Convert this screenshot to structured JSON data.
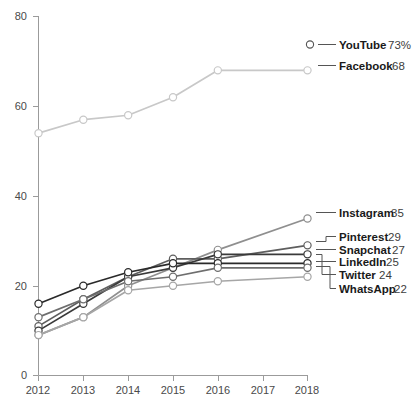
{
  "chart_data": {
    "type": "line",
    "title": "",
    "subtitle": "",
    "xlabel": "",
    "ylabel": "",
    "x": [
      2012,
      2013,
      2014,
      2015,
      2016,
      2017,
      2018
    ],
    "xtick_labels": [
      "2012",
      "2013",
      "2014",
      "2015",
      "2016",
      "2017",
      "2018"
    ],
    "ytick_labels": [
      "0",
      "20",
      "40",
      "60",
      "80"
    ],
    "yticks": [
      0,
      20,
      40,
      60,
      80
    ],
    "ylim": [
      0,
      80
    ],
    "xlim": [
      2012,
      2018
    ],
    "grid": false,
    "legend_position": "right-inline",
    "markers": "open-circle",
    "series": [
      {
        "name": "YouTube",
        "label_value": "73%",
        "end_value": 73,
        "color": "#9a9a9a",
        "values": [
          null,
          null,
          null,
          null,
          null,
          null,
          73
        ],
        "legend_only": true
      },
      {
        "name": "Facebook",
        "label_value": "68",
        "end_value": 68,
        "color": "#c8c8c8",
        "values": [
          54,
          57,
          58,
          62,
          68,
          null,
          68
        ]
      },
      {
        "name": "Instagram",
        "label_value": "35",
        "end_value": 35,
        "color": "#8f8f8f",
        "values": [
          9,
          13,
          20,
          24,
          28,
          null,
          35
        ]
      },
      {
        "name": "Pinterest",
        "label_value": "29",
        "end_value": 29,
        "color": "#5e5e5e",
        "values": [
          11,
          17,
          22,
          26,
          26,
          null,
          29
        ]
      },
      {
        "name": "Snapchat",
        "label_value": "27",
        "end_value": 27,
        "color": "#3a3a3a",
        "values": [
          10,
          16,
          22,
          24,
          27,
          null,
          27
        ]
      },
      {
        "name": "LinkedIn",
        "label_value": "25",
        "end_value": 25,
        "color": "#2a2a2a",
        "values": [
          16,
          20,
          23,
          25,
          25,
          null,
          25
        ]
      },
      {
        "name": "Twitter",
        "label_value": "24",
        "end_value": 24,
        "color": "#6e6e6e",
        "values": [
          13,
          17,
          21,
          22,
          24,
          null,
          24
        ]
      },
      {
        "name": "WhatsApp",
        "label_value": "22",
        "end_value": 22,
        "color": "#a6a6a6",
        "values": [
          9,
          13,
          19,
          20,
          21,
          null,
          22
        ]
      }
    ]
  },
  "axis": {
    "y_labels": [
      "80",
      "60",
      "40",
      "20",
      "0"
    ],
    "x_labels": [
      "2012",
      "2013",
      "2014",
      "2015",
      "2016",
      "2017",
      "2018"
    ],
    "axis_color": "#9b9b9b"
  },
  "legend": {
    "entries": [
      {
        "name": "YouTube",
        "value": "73%"
      },
      {
        "name": "Facebook",
        "value": "68"
      },
      {
        "name": "Instagram",
        "value": "35"
      },
      {
        "name": "Pinterest",
        "value": "29"
      },
      {
        "name": "Snapchat",
        "value": "27"
      },
      {
        "name": "LinkedIn",
        "value": "25"
      },
      {
        "name": "Twitter",
        "value": "24"
      },
      {
        "name": "WhatsApp",
        "value": "22"
      }
    ]
  }
}
